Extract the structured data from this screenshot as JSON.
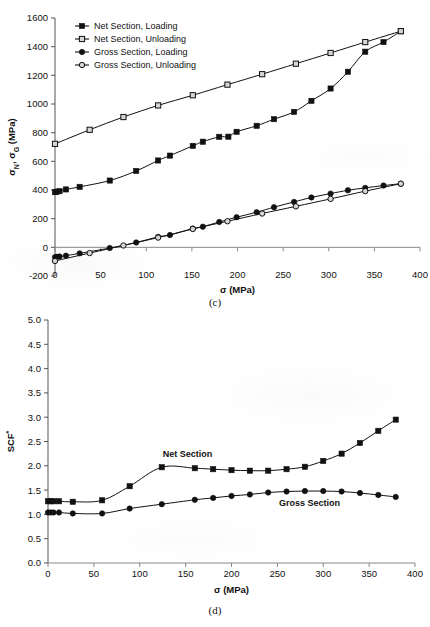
{
  "figure": {
    "panels": [
      {
        "caption": "(c)",
        "chart_ref": 0
      },
      {
        "caption": "(d)",
        "chart_ref": 1
      }
    ]
  },
  "chart_data": [
    {
      "id": "panel-c",
      "type": "line",
      "title": "",
      "caption": "(c)",
      "xlabel": "σ (MPa)",
      "ylabel": "σN, σG (MPa)",
      "ylabel_parts": {
        "sigma": "σ",
        "sub_n": "N",
        "comma": ", ",
        "sub_g": "G",
        "units": " (MPa)"
      },
      "xlim": [
        0,
        400
      ],
      "ylim": [
        -200,
        1600
      ],
      "xticks": [
        0,
        50,
        100,
        150,
        200,
        250,
        300,
        350,
        400
      ],
      "xticklabels": [
        "0",
        "50",
        "100",
        "150",
        "200",
        "250",
        "300",
        "350",
        "400"
      ],
      "yticks": [
        -200,
        0,
        200,
        400,
        600,
        800,
        1000,
        1200,
        1400,
        1600
      ],
      "yticklabels": [
        "-200",
        "0",
        "200",
        "400",
        "600",
        "800",
        "1000",
        "1200",
        "1400",
        "1600"
      ],
      "grid": false,
      "legend_position": "upper-left",
      "series": [
        {
          "name": "Net Section, Loading",
          "marker": "filled-square",
          "color": "#111111",
          "x": [
            0,
            2,
            5,
            12,
            27,
            60,
            89,
            113,
            126,
            151,
            162,
            180,
            190,
            199,
            221,
            240,
            262,
            281,
            302,
            321,
            340,
            360,
            379
          ],
          "y": [
            385,
            388,
            392,
            404,
            422,
            466,
            533,
            606,
            640,
            708,
            737,
            771,
            772,
            806,
            848,
            894,
            945,
            1022,
            1108,
            1225,
            1365,
            1432,
            1508
          ]
        },
        {
          "name": "Net Section, Unloading",
          "marker": "open-square",
          "color": "#111111",
          "x": [
            0,
            38,
            75,
            113,
            151,
            189,
            227,
            264,
            302,
            340,
            379
          ],
          "y": [
            722,
            820,
            909,
            990,
            1061,
            1135,
            1208,
            1281,
            1356,
            1432,
            1508
          ]
        },
        {
          "name": "Gross Section, Loading",
          "marker": "filled-circle",
          "color": "#111111",
          "x": [
            0,
            2,
            5,
            12,
            27,
            60,
            89,
            113,
            126,
            151,
            162,
            180,
            199,
            221,
            240,
            262,
            281,
            302,
            321,
            340,
            360,
            379
          ],
          "y": [
            -68,
            -66,
            -64,
            -58,
            -42,
            -5,
            34,
            73,
            86,
            131,
            144,
            177,
            210,
            245,
            280,
            317,
            348,
            375,
            398,
            415,
            431,
            444
          ]
        },
        {
          "name": "Gross Section, Unloading",
          "marker": "open-circle",
          "color": "#111111",
          "x": [
            0,
            38,
            75,
            113,
            151,
            189,
            227,
            264,
            302,
            340,
            379
          ],
          "y": [
            -95,
            -40,
            13,
            68,
            128,
            182,
            236,
            286,
            338,
            392,
            444
          ]
        }
      ]
    },
    {
      "id": "panel-d",
      "type": "line",
      "title": "",
      "caption": "(d)",
      "xlabel": "σ (MPa)",
      "ylabel": "SCF",
      "ylabel_superscript": "*",
      "xlim": [
        0,
        400
      ],
      "ylim": [
        0.0,
        5.0
      ],
      "xticks": [
        0,
        50,
        100,
        150,
        200,
        250,
        300,
        350,
        400
      ],
      "xticklabels": [
        "0",
        "50",
        "100",
        "150",
        "200",
        "250",
        "300",
        "350",
        "400"
      ],
      "yticks": [
        0.0,
        0.5,
        1.0,
        1.5,
        2.0,
        2.5,
        3.0,
        3.5,
        4.0,
        4.5,
        5.0
      ],
      "yticklabels": [
        "0.0",
        "0.5",
        "1.0",
        "1.5",
        "2.0",
        "2.5",
        "3.0",
        "3.5",
        "4.0",
        "4.5",
        "5.0"
      ],
      "grid": false,
      "legend_position": "none",
      "annotations": [
        {
          "text": "Net Section",
          "x": 152,
          "y": 2.18
        },
        {
          "text": "Gross Section",
          "x": 285,
          "y": 1.17
        }
      ],
      "series": [
        {
          "name": "Net Section",
          "marker": "filled-square",
          "color": "#111111",
          "x": [
            0,
            3,
            6,
            12,
            27,
            59,
            89,
            124,
            160,
            180,
            200,
            220,
            240,
            260,
            280,
            300,
            320,
            340,
            360,
            379
          ],
          "y": [
            1.27,
            1.27,
            1.27,
            1.27,
            1.26,
            1.29,
            1.58,
            1.97,
            1.95,
            1.93,
            1.91,
            1.9,
            1.9,
            1.93,
            1.98,
            2.1,
            2.25,
            2.47,
            2.72,
            2.95
          ]
        },
        {
          "name": "Gross Section",
          "marker": "filled-circle",
          "color": "#111111",
          "x": [
            0,
            3,
            6,
            12,
            27,
            59,
            89,
            124,
            160,
            180,
            200,
            220,
            240,
            260,
            280,
            300,
            320,
            340,
            360,
            379
          ],
          "y": [
            1.04,
            1.04,
            1.04,
            1.04,
            1.02,
            1.02,
            1.12,
            1.21,
            1.3,
            1.34,
            1.38,
            1.41,
            1.45,
            1.47,
            1.48,
            1.48,
            1.47,
            1.44,
            1.4,
            1.36
          ]
        }
      ]
    }
  ]
}
